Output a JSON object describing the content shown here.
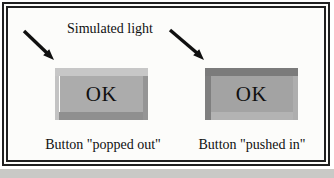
{
  "figure": {
    "light_label": "Simulated light",
    "buttons": [
      {
        "state": "popped out",
        "label": "OK",
        "caption": "Button \"popped out\"",
        "colors": {
          "face": "#acacac",
          "top": "#c7c7c7",
          "left": "#c3c3c3",
          "bottom": "#8f8f8f",
          "right": "#959595"
        }
      },
      {
        "state": "pushed in",
        "label": "OK",
        "caption": "Button \"pushed in\"",
        "colors": {
          "face": "#a3a3a3",
          "top": "#7b7b7b",
          "left": "#7f7f7f",
          "bottom": "#b3b3b3",
          "right": "#aeaeae"
        }
      }
    ],
    "frame_color": "#1f1f1f",
    "arrow_color": "#101010",
    "text_color": "#101010",
    "background": "#fcfcfa"
  }
}
